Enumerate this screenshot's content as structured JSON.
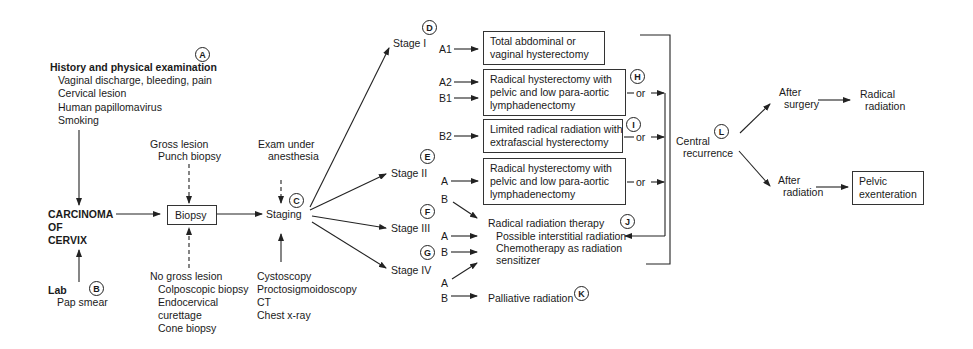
{
  "markers": {
    "A": "A",
    "B": "B",
    "C": "C",
    "D": "D",
    "E": "E",
    "F": "F",
    "G": "G",
    "H": "H",
    "I": "I",
    "J": "J",
    "K": "K",
    "L": "L"
  },
  "history": {
    "title": "History and physical examination",
    "items": [
      "Vaginal discharge, bleeding, pain",
      "Cervical lesion",
      "Human papillomavirus",
      "Smoking"
    ]
  },
  "carcinoma": {
    "lines": [
      "CARCINOMA",
      "OF",
      "CERVIX"
    ]
  },
  "lab": {
    "title": "Lab",
    "item": "Pap smear"
  },
  "gross_lesion": {
    "title": "Gross lesion",
    "item": "Punch biopsy"
  },
  "no_gross_lesion": {
    "title": "No gross lesion",
    "items": [
      "Colposcopic biopsy",
      "Endocervical",
      "curettage",
      "Cone biopsy"
    ]
  },
  "biopsy": {
    "label": "Biopsy"
  },
  "exam": {
    "lines": [
      "Exam under",
      "anesthesia"
    ]
  },
  "staging": {
    "label": "Staging",
    "tests": [
      "Cystoscopy",
      "Proctosigmoidoscopy",
      "CT",
      "Chest x-ray"
    ]
  },
  "stages": [
    {
      "label": "Stage I"
    },
    {
      "label": "Stage II"
    },
    {
      "label": "Stage III"
    },
    {
      "label": "Stage IV"
    }
  ],
  "substages": {
    "s1_a1": "A1",
    "s1_a2": "A2",
    "s1_b1": "B1",
    "s1_b2": "B2",
    "s2_a": "A",
    "s2_b": "B",
    "s3_a": "A",
    "s3_b": "B",
    "s4_a": "A",
    "s4_b": "B"
  },
  "treatments": {
    "total_hysterectomy": [
      "Total abdominal or",
      "vaginal hysterectomy"
    ],
    "radical_hysterectomy_1": [
      "Radical hysterectomy with",
      "pelvic and low para-aortic",
      "lymphadenectomy"
    ],
    "limited_radiation": [
      "Limited radical radiation with",
      "extrafascial hysterectomy"
    ],
    "radical_hysterectomy_2": [
      "Radical hysterectomy with",
      "pelvic and low para-aortic",
      "lymphadenectomy"
    ],
    "radiation_therapy": {
      "title": "Radical radiation therapy",
      "items": [
        "Possible interstitial radiation",
        "Chemotherapy as radiation",
        "sensitizer"
      ]
    },
    "palliative": "Palliative radiation"
  },
  "or_label": "or",
  "recurrence": {
    "lines": [
      "Central",
      "recurrence"
    ],
    "after_surgery": [
      "After",
      "surgery"
    ],
    "after_radiation": [
      "After",
      "radiation"
    ],
    "radical_radiation": [
      "Radical",
      "radiation"
    ],
    "pelvic_exenteration": [
      "Pelvic",
      "exenteration"
    ]
  }
}
